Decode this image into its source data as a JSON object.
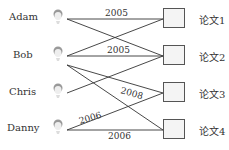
{
  "people": [
    {
      "name": "Adam"
    },
    {
      "name": "Bob"
    },
    {
      "name": "Chris"
    },
    {
      "name": "Danny"
    }
  ],
  "papers": [
    {
      "label": "论文1"
    },
    {
      "label": "论文2"
    },
    {
      "label": "论文3"
    },
    {
      "label": "论文4"
    }
  ],
  "edges": [
    {
      "from": "Adam",
      "to": "论文1",
      "year": "2005"
    },
    {
      "from": "Adam",
      "to": "论文2",
      "year": ""
    },
    {
      "from": "Bob",
      "to": "论文1",
      "year": ""
    },
    {
      "from": "Bob",
      "to": "论文2",
      "year": "2005"
    },
    {
      "from": "Bob",
      "to": "论文3",
      "year": "2008"
    },
    {
      "from": "Bob",
      "to": "论文4",
      "year": ""
    },
    {
      "from": "Chris",
      "to": "论文2",
      "year": ""
    },
    {
      "from": "Danny",
      "to": "论文3",
      "year": "2006"
    },
    {
      "from": "Danny",
      "to": "论文4",
      "year": "2006"
    }
  ],
  "labels": {
    "adam_paper1": "2005",
    "bob_paper2": "2005",
    "bob_paper3": "2008",
    "danny_paper3": "2006",
    "danny_paper4": "2006"
  }
}
